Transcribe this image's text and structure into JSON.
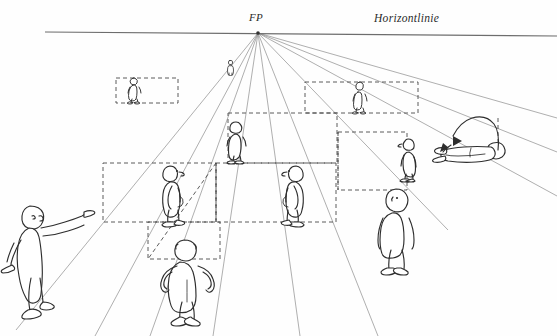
{
  "figure": {
    "type": "perspective-diagram",
    "language": "de",
    "background_color": "#ffffff",
    "ink_color": "#333333",
    "construction_line_color": "#8a8a8a",
    "dashed_line_color": "#555555"
  },
  "labels": {
    "vanishing_point": "FP",
    "horizon_line": "Horizontlinie"
  },
  "geometry": {
    "vanishing_point": {
      "x": 258,
      "y": 33
    },
    "horizon_line": {
      "x1": 45,
      "y1": 32,
      "x2": 557,
      "y2": 36
    },
    "ground_rails": [
      {
        "name": "rail-near",
        "y": 222
      },
      {
        "name": "rail-far",
        "y": 163
      },
      {
        "name": "rail-upper",
        "y": 103
      }
    ],
    "convergence_rays": [
      {
        "name": "ray-1",
        "to_x": 18,
        "to_y": 336
      },
      {
        "name": "ray-2",
        "to_x": 96,
        "to_y": 336
      },
      {
        "name": "ray-3",
        "to_x": 150,
        "to_y": 336
      },
      {
        "name": "ray-4",
        "to_x": 214,
        "to_y": 336
      },
      {
        "name": "ray-5",
        "to_x": 300,
        "to_y": 336
      },
      {
        "name": "ray-6",
        "to_x": 380,
        "to_y": 336
      },
      {
        "name": "ray-7",
        "to_x": 452,
        "to_y": 220
      },
      {
        "name": "ray-8",
        "to_x": 557,
        "to_y": 150
      },
      {
        "name": "ray-9",
        "to_x": 557,
        "to_y": 196
      }
    ]
  },
  "dashed_boxes": [
    {
      "name": "box-far-left",
      "x": 116,
      "y": 78,
      "w": 60,
      "h": 25
    },
    {
      "name": "box-far-right",
      "x": 305,
      "y": 82,
      "w": 112,
      "h": 30
    },
    {
      "name": "box-mid-left",
      "x": 103,
      "y": 163,
      "w": 112,
      "h": 59
    },
    {
      "name": "box-mid-center",
      "x": 215,
      "y": 163,
      "w": 120,
      "h": 59
    },
    {
      "name": "box-mid-right",
      "x": 338,
      "y": 132,
      "w": 68,
      "h": 58
    },
    {
      "name": "box-near-bottom",
      "x": 148,
      "y": 222,
      "w": 72,
      "h": 36
    },
    {
      "name": "box-upper-center",
      "x": 228,
      "y": 113,
      "w": 108,
      "h": 50
    }
  ],
  "figures": [
    {
      "name": "figure-pointer-left",
      "pose": "standing, arm extended pointing right",
      "x": 10,
      "y": 195,
      "w": 82,
      "h": 118,
      "station_point": true
    },
    {
      "name": "figure-hands-on-hips-front",
      "pose": "back view, hands on hips",
      "x": 158,
      "y": 236,
      "w": 58,
      "h": 88
    },
    {
      "name": "figure-profile-right",
      "pose": "profile facing right",
      "x": 162,
      "y": 164,
      "w": 30,
      "h": 60
    },
    {
      "name": "figure-profile-left",
      "pose": "profile facing left",
      "x": 283,
      "y": 164,
      "w": 30,
      "h": 60
    },
    {
      "name": "figure-small-center",
      "pose": "front standing, small",
      "x": 228,
      "y": 121,
      "w": 22,
      "h": 42
    },
    {
      "name": "figure-standing-right",
      "pose": "front standing",
      "x": 377,
      "y": 188,
      "w": 40,
      "h": 84
    },
    {
      "name": "figure-profile-right-far",
      "pose": "profile facing left, mid-distance",
      "x": 400,
      "y": 137,
      "w": 22,
      "h": 44
    },
    {
      "name": "figure-tiny-left",
      "pose": "front standing, far distance",
      "x": 128,
      "y": 77,
      "w": 13,
      "h": 26
    },
    {
      "name": "figure-tiny-right",
      "pose": "front standing, far distance",
      "x": 354,
      "y": 81,
      "w": 12,
      "h": 31
    },
    {
      "name": "figure-minute-center",
      "pose": "front standing, extreme distance",
      "x": 228,
      "y": 60,
      "w": 6,
      "h": 14
    },
    {
      "name": "figure-reclining-right",
      "pose": "lying down, horizontal",
      "x": 441,
      "y": 142,
      "w": 92,
      "h": 26
    }
  ],
  "annotations": [
    {
      "name": "rotation-arrow",
      "description": "curved arrow indicating rotation of reclining figure",
      "x": 455,
      "y": 120,
      "w": 72,
      "h": 35
    }
  ]
}
